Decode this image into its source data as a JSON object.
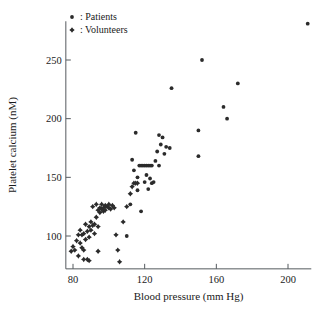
{
  "chart_data": {
    "type": "scatter",
    "title": "",
    "xlabel": "Blood pressure (mm Hg)",
    "ylabel": "Platelet calcium (nM)",
    "xlim": [
      76,
      213
    ],
    "ylim": [
      72,
      283
    ],
    "xticks": [
      80,
      120,
      160,
      200
    ],
    "yticks": [
      100,
      150,
      200,
      250
    ],
    "grid": false,
    "legend_position": "top-left",
    "legend": [
      {
        "marker": "dot",
        "separator": ":",
        "label": "Patients"
      },
      {
        "marker": "diamond",
        "separator": ":",
        "label": "Volunteers"
      }
    ],
    "series": [
      {
        "name": "Volunteers",
        "marker": "diamond",
        "color": "#2b2b2b",
        "points": [
          [
            79,
            87
          ],
          [
            80,
            91
          ],
          [
            81,
            88
          ],
          [
            82,
            96
          ],
          [
            83,
            101
          ],
          [
            83,
            83
          ],
          [
            84,
            94
          ],
          [
            84,
            105
          ],
          [
            85,
            90
          ],
          [
            85,
            101
          ],
          [
            86,
            88
          ],
          [
            86,
            102
          ],
          [
            86,
            80
          ],
          [
            87,
            97
          ],
          [
            87,
            110
          ],
          [
            88,
            104
          ],
          [
            88,
            80
          ],
          [
            89,
            108
          ],
          [
            89,
            99
          ],
          [
            90,
            112
          ],
          [
            90,
            105
          ],
          [
            91,
            109
          ],
          [
            91,
            125
          ],
          [
            92,
            110
          ],
          [
            92,
            102
          ],
          [
            93,
            116
          ],
          [
            93,
            127
          ],
          [
            94,
            122
          ],
          [
            94,
            108
          ],
          [
            95,
            124
          ],
          [
            95,
            120
          ],
          [
            96,
            123
          ],
          [
            96,
            127
          ],
          [
            97,
            121
          ],
          [
            97,
            124
          ],
          [
            98,
            126
          ],
          [
            98,
            122
          ],
          [
            99,
            125
          ],
          [
            100,
            124
          ],
          [
            100,
            127
          ],
          [
            101,
            123
          ],
          [
            102,
            126
          ],
          [
            103,
            124
          ],
          [
            104,
            101
          ],
          [
            105,
            88
          ],
          [
            106,
            78
          ],
          [
            108,
            112
          ],
          [
            110,
            125
          ],
          [
            112,
            136
          ],
          [
            113,
            142
          ],
          [
            114,
            145
          ],
          [
            115,
            145
          ],
          [
            116,
            145
          ],
          [
            94,
            87
          ],
          [
            89,
            79
          ]
        ]
      },
      {
        "name": "Patients",
        "marker": "dot",
        "color": "#2b2b2b",
        "points": [
          [
            113,
            165
          ],
          [
            114,
            156
          ],
          [
            115,
            188
          ],
          [
            116,
            150
          ],
          [
            117,
            160
          ],
          [
            118,
            160
          ],
          [
            119,
            160
          ],
          [
            120,
            160
          ],
          [
            121,
            160
          ],
          [
            122,
            160
          ],
          [
            123,
            160
          ],
          [
            124,
            160
          ],
          [
            120,
            146
          ],
          [
            121,
            152
          ],
          [
            122,
            140
          ],
          [
            123,
            149
          ],
          [
            124,
            145
          ],
          [
            125,
            146
          ],
          [
            126,
            164
          ],
          [
            127,
            172
          ],
          [
            128,
            186
          ],
          [
            129,
            178
          ],
          [
            130,
            184
          ],
          [
            131,
            170
          ],
          [
            132,
            176
          ],
          [
            134,
            175
          ],
          [
            118,
            121
          ],
          [
            135,
            226
          ],
          [
            150,
            190
          ],
          [
            150,
            168
          ],
          [
            152,
            250
          ],
          [
            164,
            210
          ],
          [
            166,
            200
          ],
          [
            172,
            230
          ],
          [
            211,
            281
          ],
          [
            116,
            139
          ],
          [
            112,
            127
          ],
          [
            110,
            100
          ],
          [
            128,
            160
          ]
        ]
      }
    ]
  }
}
